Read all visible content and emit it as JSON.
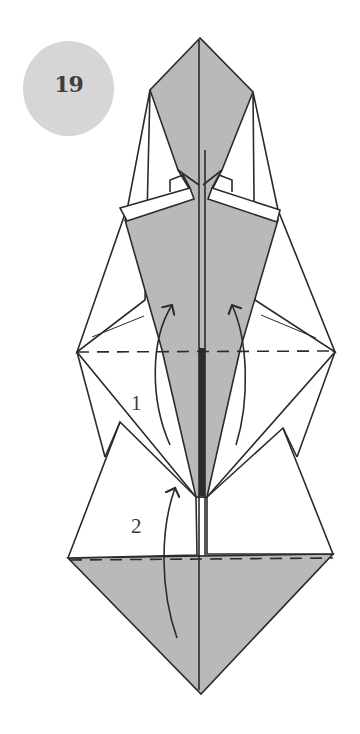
{
  "step": {
    "number": "19"
  },
  "diagram": {
    "type": "origami-instruction",
    "labels": {
      "fold_1": "1",
      "fold_2": "2"
    },
    "colors": {
      "paper_colored": "#b9b9b9",
      "paper_white": "#ffffff",
      "line": "#2b2b2b",
      "badge": "#d6d6d6",
      "badge_text": "#3e3e3e"
    },
    "notes": [
      "valley fold line (dashed) across upper section",
      "valley fold line (dashed) across lower section",
      "arrow 1: fold flaps up along inner edges",
      "arrow 2: fold bottom triangle up"
    ]
  }
}
